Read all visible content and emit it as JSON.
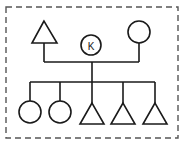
{
  "diagram": {
    "type": "genogram",
    "border": {
      "style": "dashed",
      "color": "#555555"
    },
    "parents": [
      {
        "id": "father",
        "shape": "triangle",
        "sex": "male"
      },
      {
        "id": "mother",
        "shape": "circle",
        "sex": "female"
      }
    ],
    "index_person": {
      "id": "K",
      "shape": "circle",
      "label": "K"
    },
    "children": [
      {
        "id": "child1",
        "shape": "circle",
        "sex": "female"
      },
      {
        "id": "child2",
        "shape": "circle",
        "sex": "female"
      },
      {
        "id": "child3",
        "shape": "triangle",
        "sex": "male"
      },
      {
        "id": "child4",
        "shape": "triangle",
        "sex": "male"
      },
      {
        "id": "child5",
        "shape": "triangle",
        "sex": "male"
      }
    ]
  }
}
